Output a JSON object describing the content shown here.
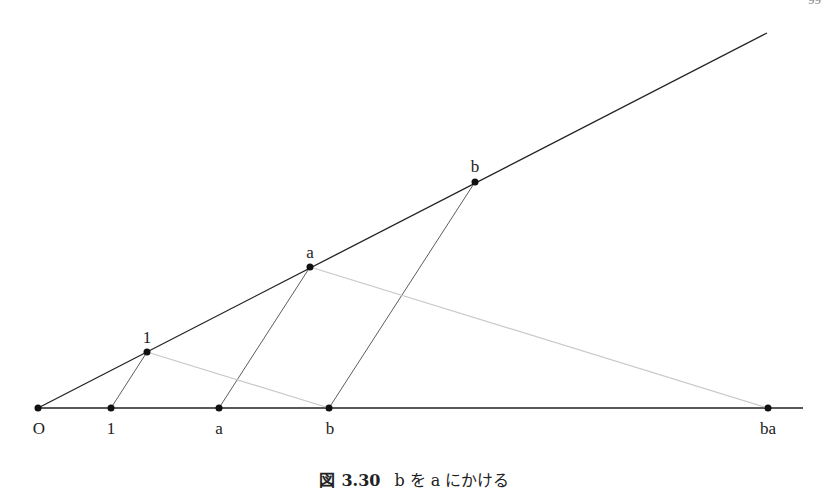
{
  "page_number": "99",
  "caption": {
    "prefix": "図",
    "number": "3.30",
    "text": "b を a にかける"
  },
  "labels": {
    "origin": "O",
    "bottom_one": "1",
    "bottom_a": "a",
    "bottom_b": "b",
    "bottom_ba": "ba",
    "ray_one": "1",
    "ray_a": "a",
    "ray_b": "b"
  },
  "colors": {
    "line": "#222222",
    "thin_line": "#333333",
    "light_line": "#c8c8c8"
  }
}
